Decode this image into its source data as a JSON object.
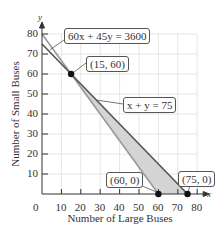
{
  "chart_data": {
    "type": "line",
    "title": "",
    "xlabel": "Number of Large Buses",
    "ylabel": "Number of Small Buses",
    "x_axis_symbol": "x",
    "y_axis_symbol": "y",
    "xlim": [
      0,
      80
    ],
    "ylim": [
      0,
      80
    ],
    "x_ticks": [
      "0",
      "10",
      "20",
      "30",
      "40",
      "50",
      "60",
      "70",
      "80"
    ],
    "y_ticks": [
      "10",
      "20",
      "30",
      "40",
      "50",
      "60",
      "70",
      "80"
    ],
    "grid": true,
    "series": [
      {
        "name": "60x + 45y = 3600",
        "points": [
          [
            0,
            80
          ],
          [
            60,
            0
          ]
        ]
      },
      {
        "name": "x + y = 75",
        "points": [
          [
            0,
            75
          ],
          [
            75,
            0
          ]
        ]
      }
    ],
    "shaded_region": {
      "vertices": [
        [
          15,
          60
        ],
        [
          60,
          0
        ],
        [
          75,
          0
        ]
      ]
    },
    "labeled_points": [
      {
        "label": "(15, 60)",
        "x": 15,
        "y": 60
      },
      {
        "label": "(60, 0)",
        "x": 60,
        "y": 0
      },
      {
        "label": "(75, 0)",
        "x": 75,
        "y": 0
      }
    ],
    "annotations": [
      "60x + 45y = 3600",
      "x + y = 75"
    ]
  }
}
